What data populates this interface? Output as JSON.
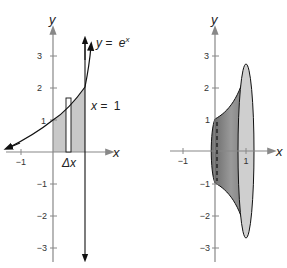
{
  "left_panel": {
    "axis_y_label": "y",
    "axis_x_label": "x",
    "curve_label_lhs": "y =",
    "curve_label_base": "e",
    "curve_label_exp": "x",
    "line_label_lhs": "x =",
    "line_label_value": "1",
    "strip_label": "Δx",
    "y_ticks": [
      "3",
      "2",
      "1",
      "−1",
      "−2",
      "−3"
    ],
    "x_ticks": [
      "−1"
    ]
  },
  "right_panel": {
    "axis_y_label": "y",
    "axis_x_label": "x",
    "y_ticks": [
      "3",
      "2",
      "1",
      "−1",
      "−2",
      "−3"
    ],
    "x_ticks": [
      "−1",
      "1"
    ]
  },
  "colors": {
    "region_fill": "#c8c8c8",
    "solid_dark": "#8a8a8a",
    "solid_light": "#cfcfcf",
    "axis": "#888888",
    "curve": "#111111"
  }
}
